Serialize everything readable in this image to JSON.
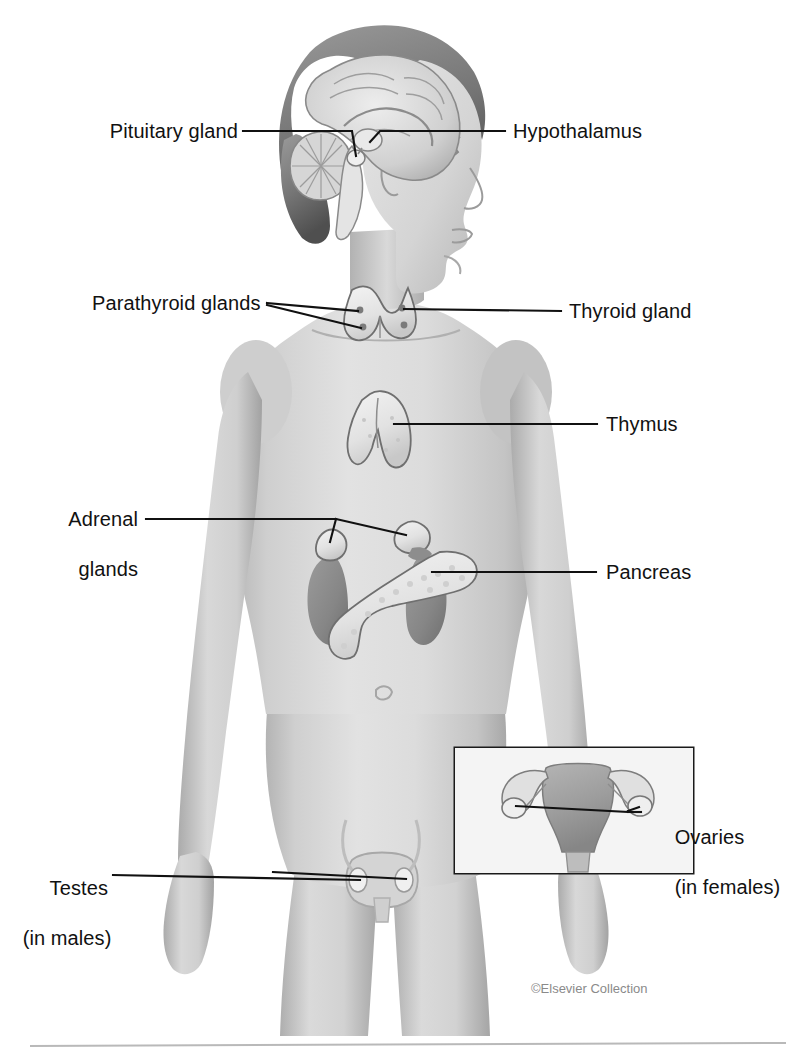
{
  "figure": {
    "credit": "©Elsevier Collection",
    "background_color": "#ffffff",
    "leader_color": "#111111",
    "label_color": "#111111",
    "credit_color": "#8a8a8a"
  },
  "labels": {
    "pituitary": "Pituitary gland",
    "hypothalamus": "Hypothalamus",
    "parathyroid": "Parathyroid glands",
    "thyroid": "Thyroid gland",
    "thymus": "Thymus",
    "adrenal_line1": "Adrenal",
    "adrenal_line2": "glands",
    "pancreas": "Pancreas",
    "ovaries_line1": "Ovaries",
    "ovaries_line2": "(in females)",
    "testes_line1": "Testes",
    "testes_line2": "(in males)"
  },
  "structures": [
    {
      "name": "pituitary-gland",
      "label": "Pituitary gland",
      "side": "left"
    },
    {
      "name": "hypothalamus",
      "label": "Hypothalamus",
      "side": "right"
    },
    {
      "name": "parathyroid-glands",
      "label": "Parathyroid glands",
      "side": "left"
    },
    {
      "name": "thyroid-gland",
      "label": "Thyroid gland",
      "side": "right"
    },
    {
      "name": "thymus",
      "label": "Thymus",
      "side": "right"
    },
    {
      "name": "adrenal-glands",
      "label": "Adrenal glands",
      "side": "left"
    },
    {
      "name": "pancreas",
      "label": "Pancreas",
      "side": "right"
    },
    {
      "name": "ovaries",
      "label": "Ovaries (in females)",
      "side": "right"
    },
    {
      "name": "testes",
      "label": "Testes (in males)",
      "side": "left"
    }
  ],
  "colors": {
    "skin_light": "#e3e3e3",
    "skin_mid": "#c9c9c9",
    "skin_shadow": "#a9a9a9",
    "organ_light": "#ececec",
    "organ_outline": "#6f6f6f",
    "kidney": "#8d8d8d",
    "uterus": "#9a9a9a",
    "hair": "#707070",
    "brain": "#d2d2d2"
  }
}
